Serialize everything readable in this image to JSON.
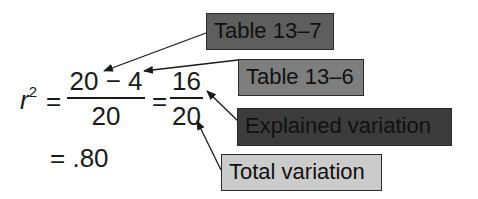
{
  "equation": {
    "lhs": "r",
    "lhs_exponent": "2",
    "equals": "=",
    "fraction1": {
      "numerator": "20 − 4",
      "denominator": "20"
    },
    "fraction2": {
      "numerator": "16",
      "denominator": "20"
    },
    "result": "= .80"
  },
  "callouts": [
    {
      "label": "Table 13–7",
      "points_to": "20 (numerator)",
      "color": "#5e5e5e"
    },
    {
      "label": "Table 13–6",
      "points_to": "4 (numerator)",
      "color": "#7e7e7e"
    },
    {
      "label": "Explained variation",
      "points_to": "16",
      "color": "#3c3c3c"
    },
    {
      "label": "Total variation",
      "points_to": "20 (denominator)",
      "color": "#cbcbcb"
    }
  ]
}
